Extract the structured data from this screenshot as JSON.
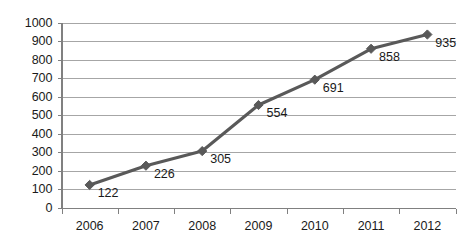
{
  "chart_data": {
    "type": "line",
    "title": "",
    "subtitle": "",
    "xlabel": "",
    "ylabel": "",
    "categories": [
      "2006",
      "2007",
      "2008",
      "2009",
      "2010",
      "2011",
      "2012"
    ],
    "values": [
      122,
      226,
      305,
      554,
      691,
      858,
      935
    ],
    "point_labels": [
      "122",
      "226",
      "305",
      "554",
      "691",
      "858",
      "935"
    ],
    "series": [
      {
        "name": "",
        "values": [
          122,
          226,
          305,
          554,
          691,
          858,
          935
        ]
      }
    ],
    "ylim": [
      0,
      1000
    ],
    "y_ticks": [
      0,
      100,
      200,
      300,
      400,
      500,
      600,
      700,
      800,
      900,
      1000
    ],
    "y_tick_labels": [
      "0",
      "100",
      "200",
      "300",
      "400",
      "500",
      "600",
      "700",
      "800",
      "900",
      "1000"
    ],
    "x_tick_labels": [
      "2006",
      "2007",
      "2008",
      "2009",
      "2010",
      "2011",
      "2012"
    ],
    "grid": true,
    "grid_axis": "y",
    "legend": false,
    "legend_position": "none",
    "marker": "diamond",
    "colors": {
      "line": "#595959",
      "marker": "#595959",
      "grid": "#a6a6a6",
      "axis": "#808080",
      "text": "#1a1a1a",
      "background": "#ffffff"
    }
  }
}
